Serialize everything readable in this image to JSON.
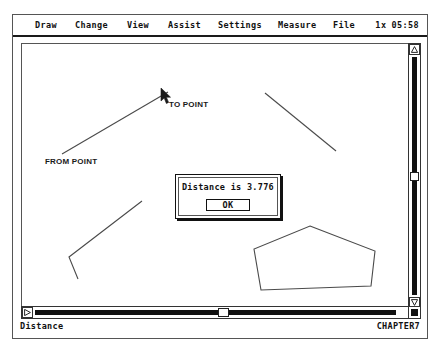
{
  "window": {
    "status_left": "Distance",
    "status_right": "CHAPTER7"
  },
  "menu": {
    "items": [
      {
        "label": "Draw",
        "x": 22
      },
      {
        "label": "Change",
        "x": 62
      },
      {
        "label": "View",
        "x": 114
      },
      {
        "label": "Assist",
        "x": 155
      },
      {
        "label": "Settings",
        "x": 205
      },
      {
        "label": "Measure",
        "x": 265
      },
      {
        "label": "File",
        "x": 320
      }
    ],
    "zoom_factor": "1x",
    "clock": "05:58"
  },
  "canvas": {
    "labels": [
      {
        "name": "to-point",
        "text": "TO POINT"
      },
      {
        "name": "from-point",
        "text": "FROM POINT"
      }
    ],
    "measure_line": {
      "x1": 40,
      "y1": 110,
      "x2": 146,
      "y2": 48
    },
    "free_line": {
      "x1": 243,
      "y1": 49,
      "x2": 314,
      "y2": 107
    },
    "chevron": "56,235 47,213 120,157",
    "pentagon": "288,182 353,207 349,242 239,246 232,205"
  },
  "dialog": {
    "message": "Distance is 3.776",
    "ok_label": "OK"
  },
  "scrollbars": {
    "vertical": {
      "up_glyph": "△",
      "down_glyph": "▽"
    },
    "horizontal": {
      "left_glyph": "◁",
      "right_glyph": "▷"
    }
  },
  "colors": {
    "frame": "#555555",
    "ink": "#111111",
    "canvas_bg": "#ffffff",
    "line": "#4a4a4a"
  }
}
